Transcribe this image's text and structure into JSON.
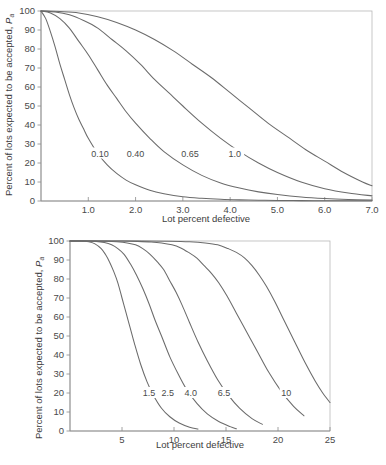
{
  "figure": {
    "background_color": "#ffffff",
    "curve_color": "#6b6b6b",
    "axis_color": "#8a8a8a",
    "frame_color": "#b8b8b8",
    "text_color": "#4a4a4a"
  },
  "charts": [
    {
      "id": "oc-curve-chart-top",
      "type": "line",
      "title": "",
      "xlabel": "Lot percent defective",
      "ylabel_main": "Percent of lots expected to be accepted, ",
      "ylabel_symbol": "P",
      "ylabel_subscript": "a",
      "xlim": [
        0,
        7.0
      ],
      "ylim": [
        0,
        100
      ],
      "grid": false,
      "legend_position": "inline-curve-labels",
      "xticks": [
        "1.0",
        "2.0",
        "3.0",
        "4.0",
        "5.0",
        "6.0",
        "7.0"
      ],
      "xtick_values": [
        1.0,
        2.0,
        3.0,
        4.0,
        5.0,
        6.0,
        7.0
      ],
      "yticks": [
        "0",
        "10",
        "20",
        "30",
        "40",
        "50",
        "60",
        "70",
        "80",
        "90",
        "100"
      ],
      "ytick_values": [
        0,
        10,
        20,
        30,
        40,
        50,
        60,
        70,
        80,
        90,
        100
      ],
      "series": [
        {
          "name": "0.10",
          "label": "0.10",
          "label_x": 1.25,
          "label_y": 25,
          "x": [
            0,
            0.1,
            0.2,
            0.3,
            0.4,
            0.5,
            0.6,
            0.7,
            0.8,
            0.9,
            1.0,
            1.2,
            1.4,
            1.6,
            1.8,
            2.0,
            2.3,
            2.6,
            3.0,
            3.4,
            3.8,
            4.2,
            4.6,
            5.0,
            5.5,
            6.0,
            6.5,
            7.0
          ],
          "y": [
            100,
            96,
            89,
            81,
            72,
            64,
            56,
            49,
            43,
            38,
            33,
            25,
            19,
            14.5,
            11,
            8.5,
            5.6,
            3.8,
            2.2,
            1.4,
            0.9,
            0.6,
            0.4,
            0.3,
            0.2,
            0.15,
            0.1,
            0.1
          ]
        },
        {
          "name": "0.40",
          "label": "0.40",
          "label_x": 2.0,
          "label_y": 25,
          "x": [
            0,
            0.2,
            0.4,
            0.6,
            0.8,
            1.0,
            1.2,
            1.4,
            1.6,
            1.8,
            2.0,
            2.3,
            2.6,
            3.0,
            3.4,
            3.8,
            4.2,
            4.6,
            5.0,
            5.5,
            6.0,
            6.5,
            7.0
          ],
          "y": [
            100,
            99,
            96,
            91,
            84,
            77,
            69,
            61,
            54,
            47,
            41,
            33,
            26,
            19,
            13.5,
            9.5,
            6.8,
            4.8,
            3.4,
            2.1,
            1.3,
            0.8,
            0.5
          ]
        },
        {
          "name": "0.65",
          "label": "0.65",
          "label_x": 3.15,
          "label_y": 25,
          "x": [
            0,
            0.3,
            0.6,
            0.9,
            1.2,
            1.5,
            1.8,
            2.1,
            2.4,
            2.7,
            3.0,
            3.4,
            3.8,
            4.2,
            4.6,
            5.0,
            5.5,
            6.0,
            6.5,
            7.0
          ],
          "y": [
            100,
            99.5,
            98,
            95,
            91,
            85,
            79,
            72,
            64,
            57,
            50,
            41,
            33,
            26,
            20,
            15,
            10,
            6.5,
            4.2,
            2.7
          ]
        },
        {
          "name": "1.0",
          "label": "1.0",
          "label_x": 4.1,
          "label_y": 25,
          "x": [
            0,
            0.4,
            0.8,
            1.2,
            1.6,
            2.0,
            2.4,
            2.8,
            3.2,
            3.6,
            4.0,
            4.4,
            4.8,
            5.2,
            5.6,
            6.0,
            6.4,
            6.8,
            7.0
          ],
          "y": [
            100,
            99.7,
            99,
            97,
            94,
            90,
            85,
            79,
            72,
            65,
            57,
            49,
            41,
            34,
            27,
            21,
            15,
            10,
            8
          ]
        }
      ]
    },
    {
      "id": "oc-curve-chart-bottom",
      "type": "line",
      "title": "",
      "xlabel": "Lot percent defective",
      "ylabel_main": "Percent of lots expected to be accepted, ",
      "ylabel_symbol": "P",
      "ylabel_subscript": "a",
      "xlim": [
        0,
        25
      ],
      "ylim": [
        0,
        100
      ],
      "grid": false,
      "legend_position": "inline-curve-labels",
      "xticks": [
        "5",
        "10",
        "15",
        "20",
        "25"
      ],
      "xtick_values": [
        5,
        10,
        15,
        20,
        25
      ],
      "yticks": [
        "0",
        "10",
        "20",
        "30",
        "40",
        "50",
        "60",
        "70",
        "80",
        "90",
        "100"
      ],
      "ytick_values": [
        0,
        10,
        20,
        30,
        40,
        50,
        60,
        70,
        80,
        90,
        100
      ],
      "series": [
        {
          "name": "1.5",
          "label": "1.5",
          "label_x": 7.6,
          "label_y": 20,
          "x": [
            0,
            1.0,
            1.8,
            2.4,
            3.0,
            3.4,
            3.8,
            4.2,
            4.6,
            5.0,
            5.4,
            5.8,
            6.2,
            6.8,
            7.4,
            8.0,
            8.8,
            9.6,
            10.5,
            11.5,
            12.3
          ],
          "y": [
            100,
            100,
            99.6,
            98.5,
            96,
            93,
            89,
            84,
            78,
            70,
            62,
            54,
            46,
            35,
            26,
            19,
            12,
            7.5,
            4.2,
            2.0,
            1.0
          ]
        },
        {
          "name": "2.5",
          "label": "2.5",
          "label_x": 9.4,
          "label_y": 20,
          "x": [
            0,
            1.5,
            2.5,
            3.3,
            4.0,
            4.6,
            5.2,
            5.8,
            6.4,
            7.0,
            7.6,
            8.2,
            8.8,
            9.6,
            10.4,
            11.2,
            12.2,
            13.2,
            14.3,
            15.4,
            16.0
          ],
          "y": [
            100,
            100,
            99.8,
            99.2,
            98,
            96,
            93,
            88,
            82,
            75,
            67,
            58,
            50,
            39,
            30,
            22,
            14.5,
            9,
            5,
            2.3,
            1.2
          ]
        },
        {
          "name": "4.0",
          "label": "4.0",
          "label_x": 11.6,
          "label_y": 20,
          "x": [
            0,
            2.0,
            3.5,
            4.5,
            5.5,
            6.3,
            7.0,
            7.7,
            8.4,
            9.0,
            9.6,
            10.2,
            10.8,
            11.5,
            12.3,
            13.2,
            14.2,
            15.2,
            16.3,
            17.5,
            18.5
          ],
          "y": [
            100,
            100,
            99.9,
            99.6,
            99,
            98,
            96,
            93,
            89,
            85,
            79,
            73,
            66,
            57,
            47,
            37,
            27,
            19,
            12,
            6.5,
            3.5
          ]
        },
        {
          "name": "6.5",
          "label": "6.5",
          "label_x": 14.8,
          "label_y": 20,
          "x": [
            0,
            3.0,
            5.0,
            6.5,
            7.8,
            8.8,
            9.8,
            10.6,
            11.4,
            12.2,
            12.9,
            13.6,
            14.3,
            15.1,
            16.0,
            17.0,
            18.0,
            19.1,
            20.3,
            21.5,
            22.5
          ],
          "y": [
            100,
            100,
            100,
            99.8,
            99.5,
            99,
            98,
            96.5,
            94,
            91,
            87,
            83,
            78,
            71,
            62,
            52,
            42,
            31,
            21,
            13,
            8
          ]
        },
        {
          "name": "10",
          "label": "10",
          "label_x": 20.8,
          "label_y": 20,
          "x": [
            0,
            4.0,
            7.0,
            9.5,
            11.5,
            13.0,
            14.2,
            15.2,
            16.0,
            16.8,
            17.5,
            18.2,
            18.9,
            19.7,
            20.6,
            21.6,
            22.6,
            23.6,
            24.3,
            25.0
          ],
          "y": [
            100,
            100,
            100,
            99.9,
            99.6,
            99,
            98,
            96,
            94,
            91,
            87,
            82,
            76,
            68,
            58,
            47,
            36,
            26,
            20,
            15
          ]
        }
      ]
    }
  ]
}
